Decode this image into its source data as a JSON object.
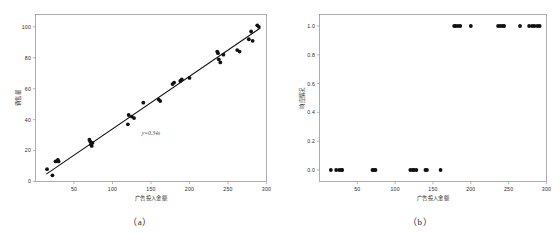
{
  "figure": {
    "background_color": "#ffffff",
    "point_color": "#111111",
    "line_color": "#111111",
    "axis_color": "#8a8a8a"
  },
  "panels": [
    {
      "caption": "（a）",
      "chart_data": {
        "type": "scatter",
        "title": "",
        "xlabel": "广告投入金额",
        "ylabel": "销售量",
        "xlim": [
          0,
          300
        ],
        "ylim": [
          0,
          108
        ],
        "xticks": [
          50,
          100,
          150,
          200,
          250,
          300
        ],
        "yticks": [
          0,
          20,
          40,
          60,
          80,
          100
        ],
        "xticklabels": [
          "50",
          "100",
          "150",
          "200",
          "250",
          "300"
        ],
        "yticklabels": [
          "0",
          "20",
          "40",
          "60",
          "80",
          "100"
        ],
        "grid": false,
        "legend": "none",
        "annotation": "y=0.34x",
        "annotation_x": 150,
        "annotation_y": 30,
        "fit_line": {
          "slope": 0.34,
          "intercept": 0.0,
          "x_start": 14,
          "x_end": 292
        },
        "x": [
          15,
          22,
          26,
          29,
          30,
          70,
          71,
          72,
          73,
          74,
          120,
          121,
          125,
          128,
          140,
          160,
          162,
          178,
          180,
          188,
          190,
          200,
          236,
          237,
          238,
          240,
          244,
          262,
          265,
          277,
          280,
          282,
          288,
          290
        ],
        "y": [
          8,
          4,
          13,
          14,
          13,
          27,
          26,
          24,
          23,
          25,
          37,
          43,
          42,
          41,
          51,
          53,
          52,
          63,
          64,
          65,
          66,
          67,
          84,
          83,
          79,
          77,
          82,
          85,
          84,
          92,
          97,
          91,
          101,
          100
        ]
      }
    },
    {
      "caption": "（b）",
      "chart_data": {
        "type": "scatter",
        "title": "",
        "xlabel": "广告投入金额",
        "ylabel": "响应情况",
        "xlim": [
          0,
          300
        ],
        "ylim": [
          -0.08,
          1.08
        ],
        "xticks": [
          50,
          100,
          150,
          200,
          250,
          300
        ],
        "yticks": [
          0.0,
          0.2,
          0.4,
          0.6,
          0.8,
          1.0
        ],
        "xticklabels": [
          "50",
          "100",
          "150",
          "200",
          "250",
          "300"
        ],
        "yticklabels": [
          "0.0",
          "0.2",
          "0.4",
          "0.6",
          "0.8",
          "1.0"
        ],
        "grid": false,
        "legend": "none",
        "x": [
          15,
          22,
          26,
          29,
          30,
          70,
          72,
          74,
          120,
          123,
          125,
          128,
          140,
          142,
          160,
          178,
          180,
          183,
          186,
          200,
          236,
          239,
          242,
          244,
          265,
          277,
          281,
          284,
          288,
          291
        ],
        "y": [
          0,
          0,
          0,
          0,
          0,
          0,
          0,
          0,
          0,
          0,
          0,
          0,
          0,
          0,
          0,
          1,
          1,
          1,
          1,
          1,
          1,
          1,
          1,
          1,
          1,
          1,
          1,
          1,
          1,
          1
        ]
      }
    }
  ]
}
